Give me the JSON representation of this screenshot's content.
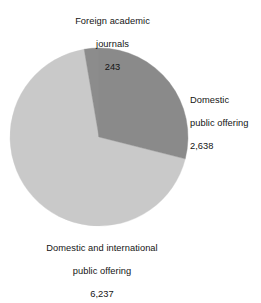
{
  "chart_data": {
    "type": "pie",
    "title": "",
    "subtitle": "",
    "xlabel": "",
    "ylabel": "",
    "legend_position": "none",
    "grid": false,
    "total": 9118,
    "categories": [
      "Foreign academic journals",
      "Domestic public offering",
      "Domestic and international public offering"
    ],
    "values": [
      243,
      2638,
      6237
    ],
    "percentages": [
      2.7,
      28.9,
      68.4
    ],
    "colors": [
      "#8c8c8c",
      "#8a8a8a",
      "#c9c9c9"
    ],
    "slices": [
      {
        "name": "Foreign academic journals",
        "value": 243,
        "value_label": "243",
        "percent": 2.7,
        "color": "#8c8c8c",
        "start_angle": 350.4,
        "end_angle": 360.0
      },
      {
        "name": "Domestic public offering",
        "value": 2638,
        "value_label": "2,638",
        "percent": 28.9,
        "color": "#8a8a8a",
        "start_angle": 0.0,
        "end_angle": 104.2
      },
      {
        "name": "Domestic and international public offering",
        "value": 6237,
        "value_label": "6,237",
        "percent": 68.4,
        "color": "#c9c9c9",
        "start_angle": 104.2,
        "end_angle": 350.4
      }
    ],
    "annotations": [
      "Foreign academic journals 243",
      "Domestic public offering 2,638",
      "Domestic and international public offering 6,237"
    ]
  },
  "labels": {
    "foreign": {
      "line1": "Foreign academic",
      "line2": "journals",
      "value": "243"
    },
    "domestic_public": {
      "line1": "Domestic",
      "line2": "public offering",
      "value": "2,638"
    },
    "domestic_intl": {
      "line1": "Domestic and international",
      "line2": "public offering",
      "value": "6,237"
    }
  },
  "geometry": {
    "center_x": 99,
    "center_y": 137,
    "radius": 89
  },
  "theme": {
    "background": "#ffffff",
    "text": "#141414",
    "slice_dark": "#8a8a8a",
    "slice_light": "#c9c9c9",
    "slice_sliver": "#8c8c8c"
  }
}
